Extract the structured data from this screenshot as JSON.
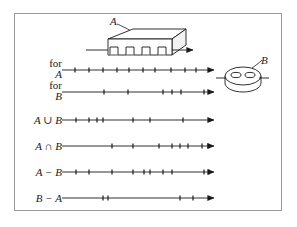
{
  "figure": {
    "background_color": "#ffffff",
    "frame_color": "#9a9a9a",
    "ink_color": "#1a1a1a"
  },
  "shapes": {
    "block": {
      "label": "A",
      "name": "slotted-block-solid"
    },
    "disc": {
      "label": "B",
      "name": "two-hole-disc-solid"
    }
  },
  "rows": [
    {
      "label_top": "for",
      "label_bottom": "A",
      "label_kind": "two-line",
      "name": "row-for-a",
      "ticks": [
        75,
        89,
        103,
        117,
        129,
        143,
        155,
        171,
        185,
        196
      ]
    },
    {
      "label_top": "for",
      "label_bottom": "B",
      "label_kind": "two-line",
      "name": "row-for-b",
      "ticks": [
        104,
        128,
        163,
        172,
        181,
        204
      ]
    },
    {
      "label": "A ∪ B",
      "label_kind": "single",
      "name": "row-a-union-b",
      "ticks": [
        76,
        89,
        97,
        103,
        133,
        150,
        183
      ]
    },
    {
      "label": "A ∩ B",
      "label_kind": "single",
      "name": "row-a-intersect-b",
      "ticks": [
        112,
        133,
        159,
        172,
        180,
        188,
        202,
        208
      ]
    },
    {
      "label": "A − B",
      "label_kind": "single",
      "name": "row-a-minus-b",
      "ticks": [
        76,
        89,
        112,
        133,
        144,
        150,
        163,
        172,
        204,
        209
      ]
    },
    {
      "label": "B − A",
      "label_kind": "single",
      "name": "row-b-minus-a",
      "ticks": [
        103,
        108,
        180,
        193
      ]
    }
  ],
  "axes": {
    "x_start": 62,
    "x_end": 214,
    "row_y": [
      70,
      92,
      120,
      146,
      172,
      198
    ]
  }
}
